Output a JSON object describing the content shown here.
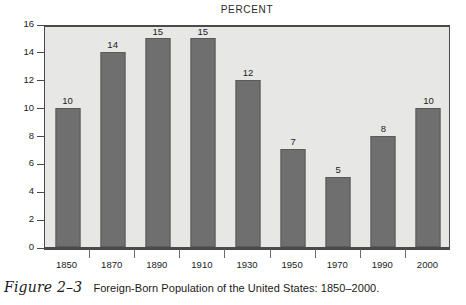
{
  "chart_data": {
    "type": "bar",
    "title": "PERCENT",
    "xlabel": "",
    "ylabel": "",
    "categories": [
      "1850",
      "1870",
      "1890",
      "1910",
      "1930",
      "1950",
      "1970",
      "1990",
      "2000"
    ],
    "values": [
      10,
      14,
      15,
      15,
      12,
      7,
      5,
      8,
      10
    ],
    "value_labels": [
      "10",
      "14",
      "15",
      "15",
      "12",
      "7",
      "5",
      "8",
      "10"
    ],
    "ylim": [
      0,
      16
    ],
    "ytick_labels": [
      "0",
      "2",
      "4",
      "6",
      "8",
      "10",
      "12",
      "14",
      "16"
    ],
    "ytick_values": [
      0,
      2,
      4,
      6,
      8,
      10,
      12,
      14,
      16
    ],
    "grid": false,
    "legend": "none",
    "bar_color": "#6f6f6f",
    "plot_background": "#e7e7e5",
    "axis_color": "#4a4a4a"
  },
  "caption": {
    "figure_number": "Figure 2–3",
    "text": "Foreign-Born Population of the United States: 1850–2000."
  }
}
